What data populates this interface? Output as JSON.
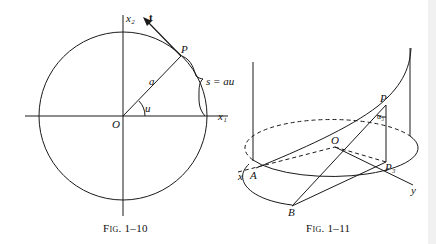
{
  "figures": [
    {
      "caption": "Fig. 1–10",
      "labels": {
        "x2_axis": "x₂",
        "x1_axis": "x₁",
        "tangent": "t",
        "point": "P",
        "radius": "a",
        "angle": "u",
        "origin": "O",
        "arc_length": "s = au"
      },
      "description": "Circle of radius a centered at origin O with axes x1, x2; point P at angle u; tangent vector t at P; arc length s = au"
    },
    {
      "caption": "Fig. 1–11",
      "labels": {
        "point": "P",
        "angle": "α₃",
        "origin": "O",
        "projection": "P₃",
        "x_axis": "x",
        "y_axis": "y",
        "point_a": "A",
        "point_b": "B"
      },
      "description": "Helix on a cylinder; point P with angle alpha3 between tangent and vertical; P3 projection of P onto base plane; tangent line from P meets base at B; arc from A"
    }
  ],
  "colors": {
    "ink": "#1a1a1a",
    "background": "#ffffff",
    "edge_strip": "#f1f1f1"
  }
}
